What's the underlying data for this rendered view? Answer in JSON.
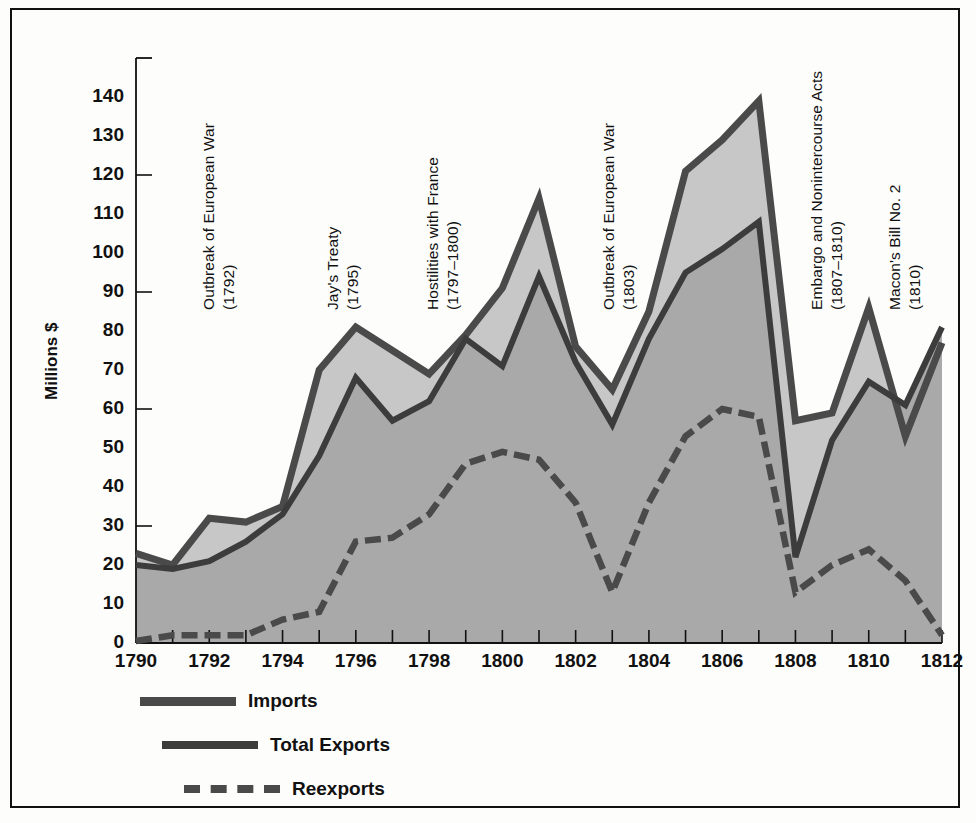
{
  "chart_data": {
    "type": "area",
    "title": "",
    "xlabel": "",
    "ylabel": "Millions $",
    "xlim": [
      1790,
      1812
    ],
    "ylim": [
      0,
      150
    ],
    "ytick_step": 10,
    "y_ticks": [
      0,
      10,
      20,
      30,
      40,
      50,
      60,
      70,
      80,
      90,
      100,
      110,
      120,
      130,
      140
    ],
    "x_ticks_labeled": [
      1790,
      1792,
      1794,
      1796,
      1798,
      1800,
      1802,
      1804,
      1806,
      1808,
      1810,
      1812
    ],
    "x_ticks_minor": [
      1791,
      1793,
      1795,
      1797,
      1799,
      1801,
      1803,
      1805,
      1807,
      1809,
      1811
    ],
    "grid": false,
    "legend_position": "below-left",
    "x": [
      1790,
      1791,
      1792,
      1793,
      1794,
      1795,
      1796,
      1797,
      1798,
      1799,
      1800,
      1801,
      1802,
      1803,
      1804,
      1805,
      1806,
      1807,
      1808,
      1809,
      1810,
      1811,
      1812
    ],
    "series": [
      {
        "name": "Imports",
        "style": "thick-solid",
        "color": "#4a4a4a",
        "values": [
          23,
          20,
          32,
          31,
          35,
          70,
          81,
          75,
          69,
          79,
          91,
          114,
          76,
          65,
          85,
          121,
          129,
          139,
          57,
          59,
          86,
          53,
          77
        ]
      },
      {
        "name": "Total Exports",
        "style": "solid",
        "color": "#3c3c3c",
        "values": [
          20,
          19,
          21,
          26,
          33,
          48,
          68,
          57,
          62,
          78,
          71,
          94,
          72,
          56,
          78,
          95,
          101,
          108,
          22,
          52,
          67,
          61,
          81
        ]
      },
      {
        "name": "Reexports",
        "style": "dashed",
        "color": "#4a4a4a",
        "values": [
          0.5,
          2,
          2,
          2,
          6,
          8,
          26,
          27,
          33,
          46,
          49,
          47,
          36,
          13,
          36,
          53,
          60,
          58,
          13,
          20,
          24,
          16,
          2
        ]
      }
    ],
    "annotations": [
      {
        "line1": "Outbreak of European War",
        "line2": "(1792)",
        "year": 1792
      },
      {
        "line1": "Jay's Treaty",
        "line2": "(1795)",
        "year": 1795
      },
      {
        "line1": "Hostilities with France",
        "line2": "(1797–1800)",
        "year": 1797
      },
      {
        "line1": "Outbreak of European War",
        "line2": "(1803)",
        "year": 1803
      },
      {
        "line1": "Essex Decision",
        "line2": "(1805)",
        "year": 1805
      },
      {
        "line1": "Embargo and Nonintercourse Acts",
        "line2": "(1807–1810)",
        "year": 1807
      },
      {
        "line1": "Macon's Bill No. 2",
        "line2": "(1810)",
        "year": 1810
      }
    ],
    "fill_colors": {
      "imports_band": "#c7c7c7",
      "exports_band": "#a9a9a9",
      "reexports_band": "#a9a9a9"
    }
  },
  "legend": {
    "items": [
      {
        "label": "Imports",
        "key": "imports-line-key"
      },
      {
        "label": "Total Exports",
        "key": "total-exports-line-key"
      },
      {
        "label": "Reexports",
        "key": "reexports-line-key"
      }
    ]
  },
  "axis": {
    "y_title": "Millions $"
  }
}
